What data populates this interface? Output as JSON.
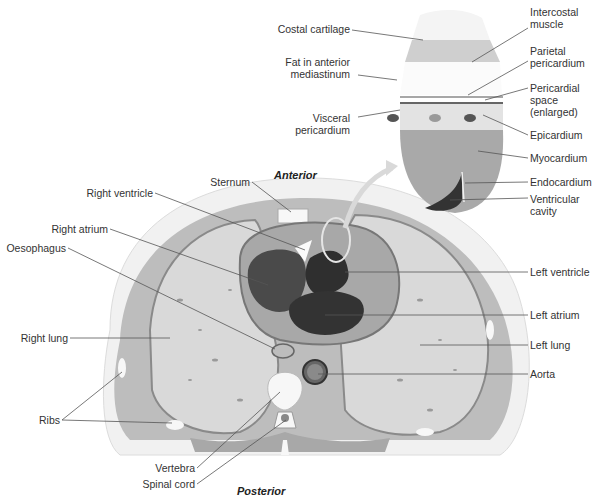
{
  "orientation": {
    "anterior": "Anterior",
    "posterior": "Posterior"
  },
  "inset_labels": {
    "costal_cartilage": "Costal cartilage",
    "fat_line1": "Fat in anterior",
    "fat_line2": "mediastinum",
    "visceral_line1": "Visceral",
    "visceral_line2": "pericardium",
    "intercostal_line1": "Intercostal",
    "intercostal_line2": "muscle",
    "parietal_line1": "Parietal",
    "parietal_line2": "pericardium",
    "pericardial_line1": "Pericardial",
    "pericardial_line2": "space",
    "pericardial_line3": "(enlarged)",
    "epicardium": "Epicardium",
    "myocardium": "Myocardium",
    "endocardium": "Endocardium",
    "ventricular_line1": "Ventricular",
    "ventricular_line2": "cavity"
  },
  "section_labels": {
    "sternum": "Sternum",
    "right_ventricle": "Right ventricle",
    "right_atrium": "Right atrium",
    "oesophagus": "Oesophagus",
    "right_lung": "Right lung",
    "ribs": "Ribs",
    "vertebra": "Vertebra",
    "spinal_cord": "Spinal cord",
    "left_ventricle": "Left ventricle",
    "left_atrium": "Left atrium",
    "left_lung": "Left lung",
    "aorta": "Aorta"
  },
  "colors": {
    "skin": "#efefef",
    "muscle": "#b9b9b9",
    "lung": "#d9d9d9",
    "heart_wall": "#9e9e9e",
    "cavity": "#3a3a3a",
    "bone": "#f7f7f7",
    "leader": "#555555"
  }
}
